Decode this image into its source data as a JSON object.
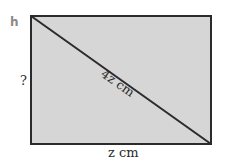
{
  "diagram": {
    "type": "rectangle-with-diagonal",
    "corner_label": "h",
    "side_label": "?",
    "bottom_label": "z cm",
    "diagonal_label": "4z cm",
    "colors": {
      "fill": "#d6d6d6",
      "stroke": "#2b2b2b",
      "background": "#ffffff"
    }
  }
}
